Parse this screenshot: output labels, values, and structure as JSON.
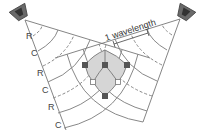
{
  "diagram": {
    "wavelength_label": "1 wavelength",
    "left_labels": [
      "R",
      "C",
      "R",
      "C",
      "R",
      "C"
    ],
    "legend_meaning": {
      "R": "rarefaction (dashed)",
      "C": "compression (solid)"
    },
    "colors": {
      "line": "#777777",
      "fill": "#d6d6d6",
      "node_dark": "#555555",
      "node_light": "#ffffff",
      "speaker": "#6a6a6a"
    }
  }
}
